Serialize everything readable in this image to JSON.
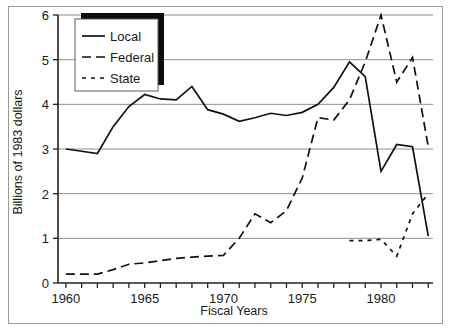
{
  "chart_data": {
    "type": "line",
    "title": "",
    "xlabel": "Fiscal Years",
    "ylabel": "Billions of 1983 dollars",
    "xlim": [
      1959.5,
      1983.3
    ],
    "ylim": [
      0,
      6
    ],
    "xticks": [
      1960,
      1961,
      1962,
      1963,
      1964,
      1965,
      1966,
      1967,
      1968,
      1969,
      1970,
      1971,
      1972,
      1973,
      1974,
      1975,
      1976,
      1977,
      1978,
      1979,
      1980,
      1981,
      1982,
      1983
    ],
    "xticklabels": [
      "1960",
      "",
      "",
      "",
      "",
      "1965",
      "",
      "",
      "",
      "",
      "1970",
      "",
      "",
      "",
      "",
      "1975",
      "",
      "",
      "",
      "",
      "1980",
      "",
      "",
      ""
    ],
    "xtick_major_labels": [
      {
        "value": 1960,
        "label": "1960"
      },
      {
        "value": 1965,
        "label": "1965"
      },
      {
        "value": 1970,
        "label": "1970"
      },
      {
        "value": 1975,
        "label": "1975"
      },
      {
        "value": 1980,
        "label": "1980"
      }
    ],
    "yticks": [
      0,
      1,
      2,
      3,
      4,
      5,
      6
    ],
    "yticklabels": [
      "0",
      "1",
      "2",
      "3",
      "4",
      "5",
      "6"
    ],
    "grid": "horizontal",
    "legend_position": "top-left-inside",
    "series": [
      {
        "name": "Local",
        "style": "solid",
        "x": [
          1960,
          1961,
          1962,
          1963,
          1964,
          1965,
          1966,
          1967,
          1968,
          1969,
          1970,
          1971,
          1972,
          1973,
          1974,
          1975,
          1976,
          1977,
          1978,
          1979,
          1980,
          1981,
          1982,
          1983
        ],
        "values": [
          3.0,
          2.95,
          2.9,
          3.5,
          3.95,
          4.22,
          4.12,
          4.1,
          4.4,
          3.88,
          3.78,
          3.62,
          3.7,
          3.8,
          3.75,
          3.82,
          4.0,
          4.38,
          4.95,
          4.62,
          2.5,
          3.1,
          3.05,
          1.05
        ]
      },
      {
        "name": "Federal",
        "style": "dashed",
        "x": [
          1960,
          1961,
          1962,
          1963,
          1964,
          1965,
          1966,
          1967,
          1968,
          1969,
          1970,
          1971,
          1972,
          1973,
          1974,
          1975,
          1976,
          1977,
          1978,
          1979,
          1980,
          1981,
          1982,
          1983
        ],
        "values": [
          0.2,
          0.2,
          0.2,
          0.3,
          0.42,
          0.45,
          0.5,
          0.55,
          0.58,
          0.6,
          0.62,
          1.0,
          1.55,
          1.35,
          1.62,
          2.35,
          3.7,
          3.65,
          4.1,
          4.95,
          6.0,
          4.5,
          5.05,
          3.05
        ]
      },
      {
        "name": "State",
        "style": "dotted",
        "x": [
          1978,
          1979,
          1980,
          1981,
          1982,
          1983
        ],
        "values": [
          0.95,
          0.95,
          0.98,
          0.6,
          1.55,
          2.0
        ]
      }
    ]
  },
  "legend": {
    "items": [
      {
        "label": "Local",
        "style": "solid"
      },
      {
        "label": "Federal",
        "style": "dashed"
      },
      {
        "label": "State",
        "style": "dotted"
      }
    ]
  }
}
